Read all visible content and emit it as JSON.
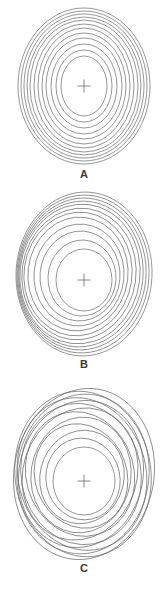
{
  "page": {
    "background_color": "#ffffff",
    "line_color": "#6a6a6a",
    "label_color": "#3a3a3a",
    "width": 168,
    "height": 595
  },
  "figures": [
    {
      "id": "a",
      "label": "A",
      "marker": "plus-cross",
      "description": "Evenly spaced concentric ellipses, symmetric about a common center",
      "center": {
        "x": 84,
        "y": 86
      },
      "marker_size": 13,
      "ring_count": 12,
      "rings": [
        {
          "rx": 23,
          "ry": 30,
          "cx": 84,
          "cy": 86,
          "rot": 0
        },
        {
          "rx": 28,
          "ry": 36,
          "cx": 84,
          "cy": 86,
          "rot": 0
        },
        {
          "rx": 33,
          "ry": 42,
          "cx": 84,
          "cy": 86,
          "rot": 0
        },
        {
          "rx": 38,
          "ry": 48,
          "cx": 84,
          "cy": 86,
          "rot": 0
        },
        {
          "rx": 42,
          "ry": 53,
          "cx": 84,
          "cy": 86,
          "rot": 0
        },
        {
          "rx": 46,
          "ry": 58,
          "cx": 84,
          "cy": 86,
          "rot": 0
        },
        {
          "rx": 50,
          "ry": 62,
          "cx": 84,
          "cy": 86,
          "rot": 0
        },
        {
          "rx": 54,
          "ry": 66,
          "cx": 84,
          "cy": 86,
          "rot": 0
        },
        {
          "rx": 57,
          "ry": 69,
          "cx": 84,
          "cy": 86,
          "rot": 0
        },
        {
          "rx": 60,
          "ry": 72,
          "cx": 84,
          "cy": 86,
          "rot": 0
        },
        {
          "rx": 63,
          "ry": 75,
          "cx": 84,
          "cy": 86,
          "rot": 0
        },
        {
          "rx": 66,
          "ry": 78,
          "cx": 84,
          "cy": 86,
          "rot": 0
        }
      ]
    },
    {
      "id": "b",
      "label": "B",
      "marker": "plus-cross",
      "description": "Concentric ellipses displaced off-center, bunching tightly on the lower-left and upper-right",
      "center": {
        "x": 84,
        "y": 92
      },
      "marker_size": 13,
      "ring_count": 12,
      "rings": [
        {
          "rx": 28,
          "ry": 31,
          "cx": 84,
          "cy": 92,
          "rot": 0
        },
        {
          "rx": 34,
          "ry": 38,
          "cx": 82,
          "cy": 90,
          "rot": 3
        },
        {
          "rx": 40,
          "ry": 45,
          "cx": 80,
          "cy": 88,
          "rot": 5
        },
        {
          "rx": 45,
          "ry": 51,
          "cx": 79,
          "cy": 87,
          "rot": 6
        },
        {
          "rx": 50,
          "ry": 57,
          "cx": 78,
          "cy": 86,
          "rot": 7
        },
        {
          "rx": 54,
          "ry": 62,
          "cx": 78,
          "cy": 86,
          "rot": 8
        },
        {
          "rx": 57,
          "ry": 66,
          "cx": 79,
          "cy": 86,
          "rot": 8
        },
        {
          "rx": 60,
          "ry": 70,
          "cx": 80,
          "cy": 86,
          "rot": 7
        },
        {
          "rx": 62,
          "ry": 73,
          "cx": 81,
          "cy": 86,
          "rot": 6
        },
        {
          "rx": 64,
          "ry": 76,
          "cx": 82,
          "cy": 86,
          "rot": 5
        },
        {
          "rx": 66,
          "ry": 79,
          "cx": 83,
          "cy": 86,
          "rot": 4
        },
        {
          "rx": 68,
          "ry": 82,
          "cx": 84,
          "cy": 86,
          "rot": 3
        }
      ]
    },
    {
      "id": "c",
      "label": "C",
      "marker": "plus-cross",
      "description": "Concentric ellipses rotated at progressively different angles, producing crossing contours",
      "center": {
        "x": 84,
        "y": 97
      },
      "marker_size": 13,
      "ring_count": 13,
      "rings": [
        {
          "rx": 31,
          "ry": 34,
          "cx": 84,
          "cy": 97,
          "rot": 0
        },
        {
          "rx": 37,
          "ry": 41,
          "cx": 83,
          "cy": 95,
          "rot": -12
        },
        {
          "rx": 42,
          "ry": 47,
          "cx": 82,
          "cy": 93,
          "rot": 14
        },
        {
          "rx": 46,
          "ry": 53,
          "cx": 81,
          "cy": 92,
          "rot": -20
        },
        {
          "rx": 50,
          "ry": 58,
          "cx": 81,
          "cy": 91,
          "rot": 8
        },
        {
          "rx": 54,
          "ry": 63,
          "cx": 80,
          "cy": 90,
          "rot": -16
        },
        {
          "rx": 57,
          "ry": 67,
          "cx": 80,
          "cy": 90,
          "rot": 18
        },
        {
          "rx": 60,
          "ry": 71,
          "cx": 81,
          "cy": 90,
          "rot": -10
        },
        {
          "rx": 62,
          "ry": 74,
          "cx": 81,
          "cy": 90,
          "rot": 12
        },
        {
          "rx": 64,
          "ry": 77,
          "cx": 82,
          "cy": 90,
          "rot": -14
        },
        {
          "rx": 66,
          "ry": 80,
          "cx": 83,
          "cy": 90,
          "rot": 6
        },
        {
          "rx": 68,
          "ry": 83,
          "cx": 83,
          "cy": 90,
          "rot": -8
        },
        {
          "rx": 70,
          "ry": 86,
          "cx": 84,
          "cy": 90,
          "rot": 10
        }
      ]
    }
  ]
}
